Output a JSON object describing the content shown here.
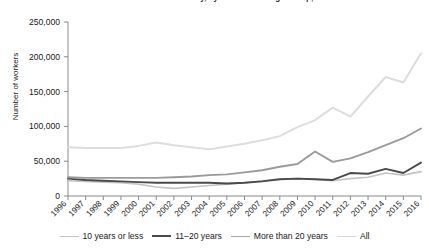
{
  "chart_data": {
    "type": "line",
    "title": "Number of Workers in the Industry, by Manufacture Age Group, 1996–2016",
    "xlabel": "",
    "ylabel": "Number of workers",
    "x": [
      1996,
      1997,
      1998,
      1999,
      2000,
      2001,
      2002,
      2003,
      2004,
      2005,
      2006,
      2007,
      2008,
      2009,
      2010,
      2011,
      2012,
      2013,
      2014,
      2015,
      2016
    ],
    "xtick_labels": [
      "1996",
      "1997",
      "1998",
      "1999",
      "2000",
      "2001",
      "2002",
      "2003",
      "2004",
      "2005",
      "2006",
      "2007",
      "2008",
      "2009",
      "2010",
      "2011",
      "2012",
      "2013",
      "2014",
      "2015",
      "2016"
    ],
    "ylim": [
      0,
      250000
    ],
    "ytick_values": [
      0,
      50000,
      100000,
      150000,
      200000,
      250000
    ],
    "ytick_labels": [
      "0",
      "50,000",
      "100,000",
      "150,000",
      "200,000",
      "250,000"
    ],
    "grid": false,
    "legend_position": "bottom",
    "series": [
      {
        "name": "10 years or less",
        "color": "#c4c4c4",
        "width": 1.6,
        "values": [
          22000,
          21000,
          20000,
          19000,
          17000,
          13000,
          11000,
          13000,
          15000,
          17000,
          19000,
          22000,
          24000,
          25000,
          24000,
          22000,
          25000,
          27000,
          33000,
          30000,
          35000
        ]
      },
      {
        "name": "11–20 years",
        "color": "#4a4a4a",
        "width": 1.9,
        "values": [
          25000,
          23000,
          22000,
          21000,
          20000,
          19000,
          19000,
          19000,
          19000,
          18000,
          19000,
          21000,
          24000,
          25000,
          24000,
          23000,
          33000,
          32000,
          39000,
          33000,
          48000
        ]
      },
      {
        "name": "More than 20 years",
        "color": "#9a9a9a",
        "width": 1.9,
        "values": [
          27000,
          26000,
          26000,
          26000,
          26000,
          26000,
          27000,
          28000,
          30000,
          31000,
          34000,
          37000,
          42000,
          46000,
          64000,
          49000,
          54000,
          63000,
          73000,
          83000,
          97000
        ]
      },
      {
        "name": "All",
        "color": "#dddddd",
        "width": 2.0,
        "values": [
          70000,
          69000,
          69000,
          69000,
          72000,
          77000,
          73000,
          70000,
          67000,
          71000,
          75000,
          80000,
          86000,
          99000,
          109000,
          127000,
          114000,
          143000,
          171000,
          163000,
          205000
        ]
      }
    ]
  },
  "legend": [
    {
      "label": "10 years or less",
      "color": "#c4c4c4",
      "width": 1.6
    },
    {
      "label": "11–20 years",
      "color": "#4a4a4a",
      "width": 2.0
    },
    {
      "label": "More than 20 years",
      "color": "#a8a8a8",
      "width": 1.6
    },
    {
      "label": "All",
      "color": "#d8d8d8",
      "width": 1.6
    }
  ]
}
